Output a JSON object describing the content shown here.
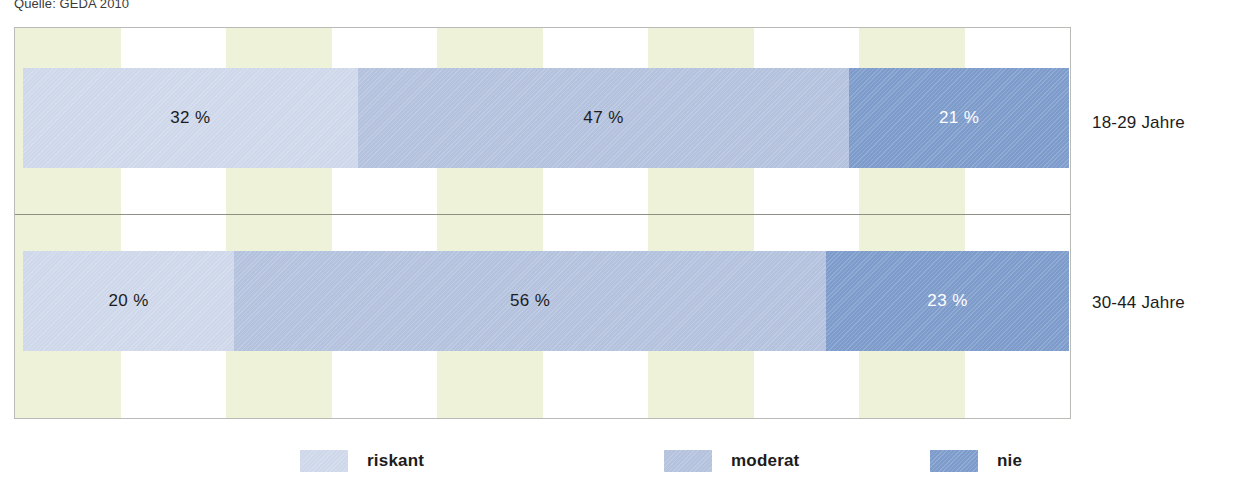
{
  "source_note": "Quelle: GEDA 2010",
  "chart_data": {
    "type": "bar",
    "orientation": "horizontal",
    "stacked": true,
    "title": "",
    "subtitle": "",
    "xlabel": "",
    "ylabel": "",
    "xlim": [
      0,
      100
    ],
    "grid": true,
    "grid_style": "vertical alternating bands",
    "legend_position": "bottom",
    "categories": [
      "18-29 Jahre",
      "30-44 Jahre"
    ],
    "series": [
      {
        "name": "riskant",
        "color": "#cfd8ea",
        "values": [
          32,
          20
        ],
        "value_labels": [
          "32 %",
          "20 %"
        ]
      },
      {
        "name": "moderat",
        "color": "#b4c2de",
        "values": [
          47,
          56
        ],
        "value_labels": [
          "47 %",
          "56 %"
        ]
      },
      {
        "name": "nie",
        "color": "#7d9bcb",
        "values": [
          21,
          23
        ],
        "value_labels": [
          "21 %",
          "23 %"
        ]
      }
    ]
  },
  "legend": {
    "items": [
      {
        "label": "riskant",
        "color": "#cfd8ea"
      },
      {
        "label": "moderat",
        "color": "#b4c2de"
      },
      {
        "label": "nie",
        "color": "#7d9bcb"
      }
    ]
  },
  "colors": {
    "band": "#eef2d8",
    "frame_border": "#b9bcb6",
    "divider": "#8d9184",
    "label_dark": "#1c1c1c",
    "label_light": "#ffffff"
  }
}
